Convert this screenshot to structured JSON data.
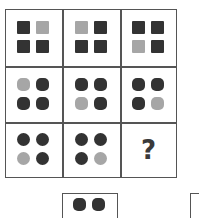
{
  "puzzle": {
    "colors": {
      "dark": "#333333",
      "light": "#a6a6a6",
      "border": "#555555"
    },
    "grid": [
      [
        {
          "shape": "square",
          "fills": [
            "dark",
            "light",
            "dark",
            "dark"
          ]
        },
        {
          "shape": "square",
          "fills": [
            "light",
            "dark",
            "dark",
            "dark"
          ]
        },
        {
          "shape": "square",
          "fills": [
            "dark",
            "dark",
            "light",
            "dark"
          ]
        }
      ],
      [
        {
          "shape": "rounded-square",
          "fills": [
            "light",
            "dark",
            "dark",
            "dark"
          ]
        },
        {
          "shape": "rounded-square",
          "fills": [
            "dark",
            "dark",
            "light",
            "dark"
          ]
        },
        {
          "shape": "rounded-square",
          "fills": [
            "dark",
            "dark",
            "dark",
            "light"
          ]
        }
      ],
      [
        {
          "shape": "circle",
          "fills": [
            "dark",
            "dark",
            "light",
            "dark"
          ]
        },
        {
          "shape": "circle",
          "fills": [
            "dark",
            "dark",
            "dark",
            "light"
          ]
        },
        {
          "question": "?"
        }
      ]
    ],
    "options": [
      {
        "shape": "rounded-square",
        "fills_visible": [
          "dark",
          "dark"
        ]
      },
      {
        "shape": "unknown",
        "fills_visible": []
      }
    ]
  }
}
